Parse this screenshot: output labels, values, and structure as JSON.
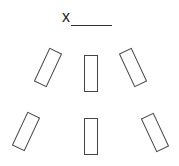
{
  "diagram": {
    "type": "seating-arrangement",
    "marker": {
      "label": "x",
      "blank_line": true
    },
    "colors": {
      "stroke": "#444444",
      "background": "#ffffff"
    },
    "rectangles": [
      {
        "id": "upper-left",
        "cx": 48,
        "cy": 67,
        "rotation_deg": 25
      },
      {
        "id": "upper-center",
        "cx": 91,
        "cy": 74,
        "rotation_deg": 0
      },
      {
        "id": "upper-right",
        "cx": 133,
        "cy": 67,
        "rotation_deg": -25
      },
      {
        "id": "lower-left",
        "cx": 26,
        "cy": 131,
        "rotation_deg": 25
      },
      {
        "id": "lower-center",
        "cx": 91,
        "cy": 137,
        "rotation_deg": 0
      },
      {
        "id": "lower-right",
        "cx": 155,
        "cy": 132,
        "rotation_deg": -25
      }
    ]
  }
}
